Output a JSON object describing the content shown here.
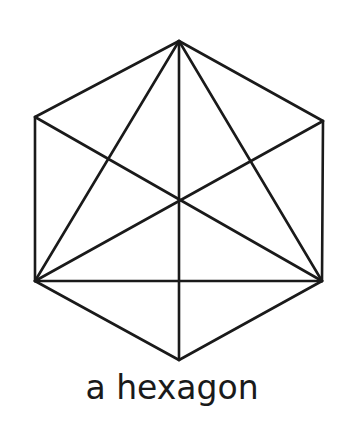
{
  "caption": "a hexagon",
  "colors": {
    "background": "#ffffff",
    "stroke": "#1a1a1a"
  },
  "diagram": {
    "shape": "hexagon",
    "vertices": {
      "top": [
        179,
        41
      ],
      "upper_right": [
        323,
        121
      ],
      "lower_right": [
        322,
        281
      ],
      "bottom": [
        179,
        360
      ],
      "lower_left": [
        35,
        281
      ],
      "upper_left": [
        35,
        117
      ]
    },
    "center": [
      179,
      201
    ],
    "edges": [
      [
        "top",
        "upper_right"
      ],
      [
        "upper_right",
        "lower_right"
      ],
      [
        "lower_right",
        "bottom"
      ],
      [
        "bottom",
        "lower_left"
      ],
      [
        "lower_left",
        "upper_left"
      ],
      [
        "upper_left",
        "top"
      ]
    ],
    "interior_lines": [
      [
        "top",
        "bottom"
      ],
      [
        "upper_left",
        "lower_right"
      ],
      [
        "upper_right",
        "lower_left"
      ],
      [
        "lower_left",
        "lower_right"
      ],
      [
        "top",
        "lower_left"
      ],
      [
        "top",
        "lower_right"
      ]
    ]
  }
}
